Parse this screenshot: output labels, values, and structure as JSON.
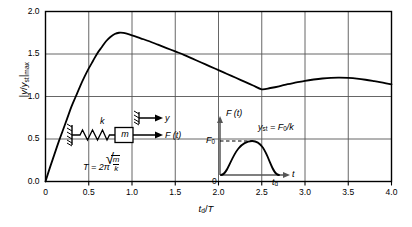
{
  "chart_data": {
    "type": "line",
    "title": "",
    "xlabel": "t_d/T",
    "ylabel": "|y/y_st|_max",
    "xlim": [
      0,
      4.0
    ],
    "ylim": [
      0,
      2.0
    ],
    "grid": true,
    "legend": "none",
    "xticks": [
      "0",
      "0.5",
      "1.0",
      "1.5",
      "2.0",
      "2.5",
      "3.0",
      "3.5",
      "4.0"
    ],
    "yticks": [
      "0.0",
      "0.5",
      "1.0",
      "1.5",
      "2.0"
    ],
    "series": [
      {
        "name": "Shock response spectrum, half-sine pulse",
        "x": [
          0.0,
          0.05,
          0.1,
          0.15,
          0.2,
          0.25,
          0.3,
          0.35,
          0.4,
          0.45,
          0.5,
          0.55,
          0.6,
          0.65,
          0.7,
          0.75,
          0.8,
          0.85,
          0.9,
          1.0,
          1.1,
          1.2,
          1.3,
          1.4,
          1.5,
          1.6,
          1.7,
          1.8,
          1.9,
          2.0,
          2.1,
          2.2,
          2.3,
          2.4,
          2.5,
          2.6,
          2.7,
          2.8,
          2.9,
          3.0,
          3.1,
          3.2,
          3.3,
          3.4,
          3.5,
          3.6,
          3.7,
          3.8,
          3.9,
          4.0
        ],
        "y": [
          0.0,
          0.16,
          0.31,
          0.46,
          0.6,
          0.74,
          0.88,
          1.0,
          1.12,
          1.23,
          1.33,
          1.42,
          1.51,
          1.58,
          1.65,
          1.7,
          1.735,
          1.75,
          1.748,
          1.72,
          1.685,
          1.65,
          1.61,
          1.57,
          1.53,
          1.49,
          1.445,
          1.4,
          1.355,
          1.31,
          1.265,
          1.22,
          1.175,
          1.13,
          1.085,
          1.1,
          1.12,
          1.145,
          1.165,
          1.185,
          1.2,
          1.212,
          1.22,
          1.222,
          1.218,
          1.21,
          1.197,
          1.18,
          1.162,
          1.142
        ]
      }
    ]
  },
  "inset_left": {
    "spring_label": "k",
    "mass_label": "m",
    "force_label": "F (t)",
    "displacement_label": "y",
    "period_label": "T = 2π",
    "period_radicand_num": "m",
    "period_radicand_den": "k"
  },
  "inset_right": {
    "yaxis_label": "F (t)",
    "xaxis_label": "t",
    "origin_label": "0",
    "f0_label": "F",
    "f0_sub": "0",
    "td_label": "t",
    "td_sub": "d",
    "relation_lhs": "y",
    "relation_lhs_sub": "st",
    "relation_rhs": " = F",
    "relation_rhs_sub": "0",
    "relation_tail": "/k"
  },
  "colors": {
    "curve": "#000000",
    "grid": "#555555",
    "axis": "#000000",
    "inset_axis": "#555555",
    "background": "#ffffff"
  }
}
